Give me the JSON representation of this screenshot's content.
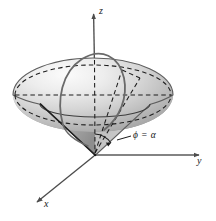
{
  "figure": {
    "background_color": "#ffffff",
    "width": 216,
    "height": 221
  },
  "axes": {
    "z": {
      "label": "z",
      "direction": "up",
      "arrow": true,
      "origin": {
        "x": 95,
        "y": 155
      },
      "tip": {
        "x": 93,
        "y": 12
      },
      "label_pos": {
        "x": 99,
        "y": 9
      }
    },
    "y": {
      "label": "y",
      "direction": "right",
      "arrow": true,
      "origin": {
        "x": 95,
        "y": 155
      },
      "tip": {
        "x": 202,
        "y": 155
      },
      "label_pos": {
        "x": 197,
        "y": 159
      }
    },
    "x": {
      "label": "x",
      "direction": "lower-left",
      "arrow": true,
      "origin": {
        "x": 95,
        "y": 155
      },
      "tip": {
        "x": 34,
        "y": 205
      },
      "label_pos": {
        "x": 43,
        "y": 205
      }
    }
  },
  "annotations": [
    {
      "id": "cone-angle-label",
      "text": "ϕ = α",
      "leader_from": {
        "x": 130,
        "y": 141
      },
      "leader_to": {
        "x": 118,
        "y": 136
      },
      "label_pos": {
        "x": 133,
        "y": 136
      }
    }
  ],
  "solid": {
    "name": "ice-cream-cone region",
    "ellipsoid": {
      "center": {
        "x": 93,
        "y": 95
      },
      "rx": 80,
      "ry": 37,
      "fill_light": "#f2f2f2",
      "fill_mid": "#c9c9c9",
      "fill_dark": "#8f8f8f",
      "outline_color": "#4a4a4a"
    },
    "cone": {
      "apex": {
        "x": 95,
        "y": 155
      },
      "rim_ry": 13,
      "fill_light": "#d8d8d8",
      "fill_dark": "#909090",
      "outline_color": "#3a3a3a"
    },
    "meridian_curve": {
      "description": "solid phi = alpha meridian arc drawn on the surface",
      "color": "#5a5a5a"
    },
    "dashed_color": "#1f1f1f",
    "equator_dashed": true,
    "hidden_axes_dashed": true
  },
  "colors": {
    "stroke": "#2b2b2b",
    "axis": "#555555",
    "dashed": "#1f1f1f",
    "text": "#141414"
  }
}
